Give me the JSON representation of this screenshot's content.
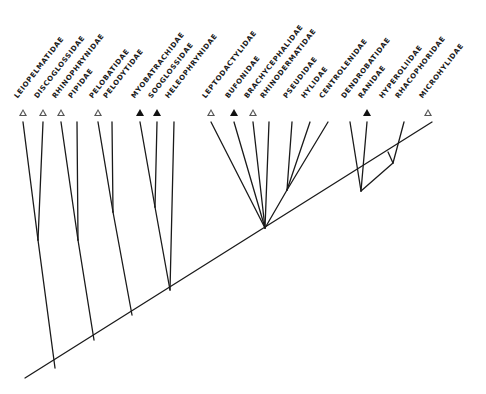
{
  "diagram": {
    "type": "cladogram",
    "colors": {
      "line": "#1a1a1a",
      "open_marker": "#555555",
      "filled_marker": "#111111",
      "background": "#ffffff"
    },
    "taxa": [
      {
        "name": "LEIOPELMATIDAE",
        "x": 23,
        "marker": "open"
      },
      {
        "name": "DISCOGLOSSIDAE",
        "x": 43,
        "marker": "open"
      },
      {
        "name": "RHINOPHRYNIDAE",
        "x": 61,
        "marker": "open"
      },
      {
        "name": "PIPIDAE",
        "x": 77,
        "marker": "none"
      },
      {
        "name": "PELOBATIDAE",
        "x": 98,
        "marker": "open"
      },
      {
        "name": "PELODYTIDAE",
        "x": 112,
        "marker": "none"
      },
      {
        "name": "MYOBATRACHIDAE",
        "x": 140,
        "marker": "filled"
      },
      {
        "name": "SOOGLOSSIDAE",
        "x": 157,
        "marker": "filled"
      },
      {
        "name": "HELEOPHRYNIDAE",
        "x": 174,
        "marker": "none"
      },
      {
        "name": "LEPTODACTYLIDAE",
        "x": 211,
        "marker": "open"
      },
      {
        "name": "BUFONIDAE",
        "x": 234,
        "marker": "filled"
      },
      {
        "name": "BRACHYCEPHALIDAE",
        "x": 253,
        "marker": "open"
      },
      {
        "name": "RHINODERMATIDAE",
        "x": 269,
        "marker": "none"
      },
      {
        "name": "PSEUDIDAE",
        "x": 292,
        "marker": "none"
      },
      {
        "name": "HYLIDAE",
        "x": 310,
        "marker": "none"
      },
      {
        "name": "CENTROLENIDAE",
        "x": 328,
        "marker": "none"
      },
      {
        "name": "DENDROBATIDAE",
        "x": 350,
        "marker": "none"
      },
      {
        "name": "RANIDAE",
        "x": 367,
        "marker": "filled"
      },
      {
        "name": "HYPEROLIIDAE",
        "x": 388,
        "marker": "none"
      },
      {
        "name": "RHACOPHORIDAE",
        "x": 404,
        "marker": "none"
      },
      {
        "name": "MICROHYLIDAE",
        "x": 428,
        "marker": "open"
      }
    ],
    "edges": [
      [
        25,
        378,
        432,
        122
      ],
      [
        38,
        240,
        23,
        122
      ],
      [
        38,
        240,
        43,
        122
      ],
      [
        38,
        240,
        55,
        368
      ],
      [
        78,
        240,
        61,
        122
      ],
      [
        78,
        240,
        77,
        122
      ],
      [
        78,
        240,
        94,
        340
      ],
      [
        113,
        212,
        98,
        122
      ],
      [
        113,
        212,
        112,
        122
      ],
      [
        113,
        212,
        132,
        315
      ],
      [
        155,
        207,
        140,
        122
      ],
      [
        155,
        207,
        157,
        122
      ],
      [
        170,
        290,
        155,
        207
      ],
      [
        170,
        290,
        174,
        122
      ],
      [
        265,
        228,
        211,
        122
      ],
      [
        265,
        228,
        234,
        122
      ],
      [
        265,
        228,
        253,
        122
      ],
      [
        265,
        228,
        269,
        122
      ],
      [
        287,
        190,
        265,
        228
      ],
      [
        287,
        190,
        292,
        122
      ],
      [
        287,
        190,
        310,
        122
      ],
      [
        287,
        190,
        328,
        122
      ],
      [
        361,
        191,
        350,
        122
      ],
      [
        361,
        191,
        367,
        122
      ],
      [
        393,
        163,
        361,
        191
      ],
      [
        393,
        163,
        388,
        152
      ],
      [
        393,
        163,
        404,
        122
      ]
    ]
  }
}
